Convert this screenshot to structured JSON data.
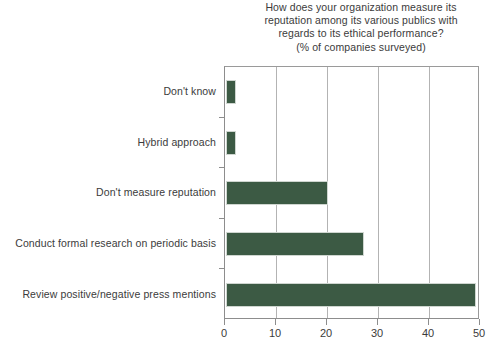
{
  "chart_data": {
    "type": "bar",
    "orientation": "horizontal",
    "title": "How does your organization measure its reputation among its various publics with regards to its ethical performance? (% of companies surveyed)",
    "title_lines": [
      "How does your organization measure its",
      "reputation among its various publics with",
      "regards to its ethical performance?",
      "(% of companies surveyed)"
    ],
    "categories": [
      "Don't know",
      "Hybrid approach",
      "Don't measure reputation",
      "Conduct formal research on periodic basis",
      "Review positive/negative press mentions"
    ],
    "values": [
      2,
      2,
      20,
      27,
      49
    ],
    "xlabel": "",
    "ylabel": "",
    "xlim": [
      0,
      50
    ],
    "xticks": [
      0,
      10,
      20,
      30,
      40,
      50
    ],
    "xtick_labels": [
      "0",
      "10",
      "20",
      "30",
      "40",
      "50"
    ],
    "grid": "vertical",
    "legend": "none",
    "bar_color": "#3c5a44",
    "grid_color": "#b3b3b3",
    "axis_color": "#8d8d8d",
    "text_color": "#3b3b3b",
    "background": "#ffffff"
  }
}
